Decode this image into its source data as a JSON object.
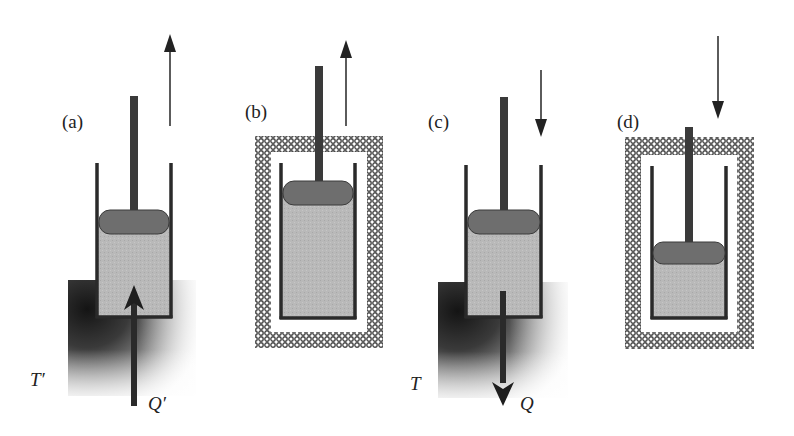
{
  "figure": {
    "colors": {
      "gas": "#b8b8b8",
      "piston": "#6e6e6e",
      "rod": "#3a3a3a",
      "wall": "#2a2a2a",
      "insulation": "#5a5a5a",
      "reservoir_dark": "#1e1e1e"
    },
    "panels": [
      {
        "id": "a",
        "label": "(a)",
        "process": "isothermal expansion",
        "work_arrow": "up",
        "insulated": false,
        "reservoir_label": "T′",
        "heat_label": "Q′",
        "heat_direction": "in"
      },
      {
        "id": "b",
        "label": "(b)",
        "process": "adiabatic expansion",
        "work_arrow": "up",
        "insulated": true
      },
      {
        "id": "c",
        "label": "(c)",
        "process": "isothermal compression",
        "work_arrow": "down",
        "insulated": false,
        "reservoir_label": "T",
        "heat_label": "Q",
        "heat_direction": "out"
      },
      {
        "id": "d",
        "label": "(d)",
        "process": "adiabatic compression",
        "work_arrow": "down",
        "insulated": true
      }
    ]
  }
}
